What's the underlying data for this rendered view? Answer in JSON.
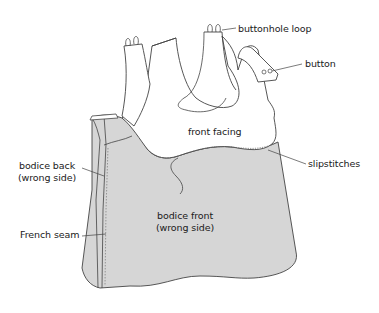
{
  "diagram": {
    "type": "sewing-illustration",
    "colors": {
      "fabric_wrong_side": "#d6d6d6",
      "facing": "#ffffff",
      "outline": "#444444",
      "text": "#1a1a1a"
    },
    "labels": {
      "buttonhole_loop": "buttonhole loop",
      "button": "button",
      "front_facing": "front facing",
      "slipstitches": "slipstitches",
      "bodice_back_line1": "bodice back",
      "bodice_back_line2": "(wrong side)",
      "bodice_front_line1": "bodice front",
      "bodice_front_line2": "(wrong side)",
      "french_seam": "French seam"
    }
  }
}
